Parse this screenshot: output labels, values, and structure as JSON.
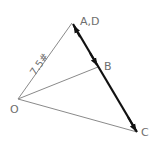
{
  "diagram": {
    "type": "force-vector-diagram",
    "points": {
      "O": {
        "label": "O",
        "x": 18,
        "y": 99
      },
      "A": {
        "label": "A,D",
        "x": 72,
        "y": 23
      },
      "B": {
        "label": "B",
        "x": 98,
        "y": 67
      },
      "C": {
        "label": "C",
        "x": 137,
        "y": 132
      }
    },
    "labels": {
      "ad": "A,D",
      "b": "B",
      "c": "C",
      "o": "O",
      "force_oa": "7.5#"
    },
    "colors": {
      "thin_line": "#8a8a8a",
      "thick_line": "#111111",
      "text": "#6e6e6e"
    }
  }
}
